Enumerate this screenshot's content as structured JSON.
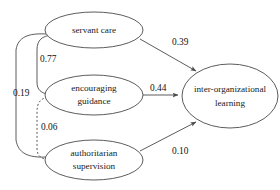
{
  "diagram": {
    "type": "path-diagram",
    "title": "",
    "nodes": [
      {
        "id": "servant_care",
        "label_lines": [
          "servant care"
        ],
        "cx": 94,
        "cy": 30,
        "rx": 49,
        "ry": 18
      },
      {
        "id": "encouraging_guidance",
        "label_lines": [
          "encouraging",
          "guidance"
        ],
        "cx": 94,
        "cy": 95,
        "rx": 49,
        "ry": 20
      },
      {
        "id": "authoritarian_supervision",
        "label_lines": [
          "authoritarian",
          "supervision"
        ],
        "cx": 94,
        "cy": 160,
        "rx": 49,
        "ry": 20
      },
      {
        "id": "inter_org_learning",
        "label_lines": [
          "inter-organizational",
          "learning"
        ],
        "cx": 230,
        "cy": 96,
        "rx": 48,
        "ry": 32
      }
    ],
    "paths": [
      {
        "id": "servant_to_learning",
        "from": "servant_care",
        "to": "inter_org_learning",
        "coefficient": "0.39",
        "label_x": 172,
        "label_y": 43,
        "style": "solid",
        "arrow": true
      },
      {
        "id": "encouraging_to_learning",
        "from": "encouraging_guidance",
        "to": "inter_org_learning",
        "coefficient": "0.44",
        "label_x": 163,
        "label_y": 90,
        "style": "solid",
        "arrow": true
      },
      {
        "id": "authoritarian_to_learning",
        "from": "authoritarian_supervision",
        "to": "inter_org_learning",
        "coefficient": "0.10",
        "label_x": 172,
        "label_y": 152,
        "style": "solid",
        "arrow": true
      }
    ],
    "correlations": [
      {
        "id": "servant_encouraging",
        "between": [
          "servant_care",
          "encouraging_guidance"
        ],
        "coefficient": "0.77",
        "label_x": 38,
        "label_y": 60,
        "style": "solid",
        "arrow": false
      },
      {
        "id": "servant_authoritarian",
        "between": [
          "servant_care",
          "authoritarian_supervision"
        ],
        "coefficient": "0.19",
        "label_x": 12,
        "label_y": 94,
        "style": "solid",
        "arrow": false
      },
      {
        "id": "encouraging_authoritarian",
        "between": [
          "encouraging_guidance",
          "authoritarian_supervision"
        ],
        "coefficient": "0.06",
        "label_x": 39,
        "label_y": 128,
        "style": "dashed",
        "arrow": false
      }
    ]
  }
}
